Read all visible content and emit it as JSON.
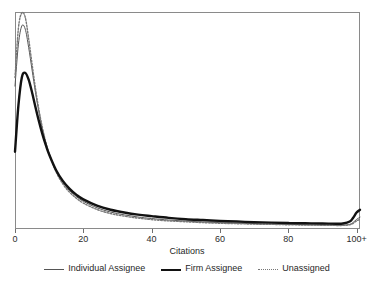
{
  "chart_data": {
    "type": "line",
    "title": "",
    "subtitle": "",
    "xlabel": "Citations",
    "ylabel": "",
    "xlim": [
      0,
      101
    ],
    "ylim": [
      0,
      1
    ],
    "grid": false,
    "legend_position": "bottom",
    "xticks": [
      0,
      20,
      40,
      60,
      80,
      100
    ],
    "xticklabels": [
      "0",
      "20",
      "40",
      "60",
      "80",
      "100+"
    ],
    "yticklabels": [],
    "annotations": [],
    "x": [
      0,
      1,
      2,
      3,
      4,
      5,
      6,
      7,
      8,
      9,
      10,
      12,
      14,
      16,
      18,
      20,
      24,
      28,
      32,
      36,
      40,
      45,
      50,
      55,
      60,
      65,
      70,
      75,
      80,
      85,
      90,
      94,
      96,
      98,
      99,
      100,
      101
    ],
    "series": [
      {
        "name": "Individual Assignee",
        "style": "solid-thin",
        "color": "#555555",
        "width": 1.0,
        "values": [
          0.66,
          0.855,
          0.94,
          0.925,
          0.84,
          0.735,
          0.63,
          0.54,
          0.462,
          0.398,
          0.346,
          0.266,
          0.212,
          0.174,
          0.146,
          0.124,
          0.094,
          0.074,
          0.061,
          0.051,
          0.044,
          0.037,
          0.032,
          0.028,
          0.025,
          0.022,
          0.02,
          0.018,
          0.017,
          0.015,
          0.014,
          0.013,
          0.013,
          0.017,
          0.026,
          0.04,
          0.05
        ]
      },
      {
        "name": "Firm Assignee",
        "style": "solid-thick",
        "color": "#121212",
        "width": 2.4,
        "values": [
          0.355,
          0.57,
          0.7,
          0.722,
          0.69,
          0.63,
          0.562,
          0.497,
          0.438,
          0.387,
          0.342,
          0.27,
          0.219,
          0.182,
          0.154,
          0.133,
          0.104,
          0.085,
          0.072,
          0.062,
          0.055,
          0.047,
          0.041,
          0.037,
          0.033,
          0.03,
          0.027,
          0.025,
          0.023,
          0.022,
          0.021,
          0.02,
          0.021,
          0.03,
          0.048,
          0.072,
          0.085
        ]
      },
      {
        "name": "Unassigned",
        "style": "dotted",
        "color": "#777777",
        "width": 1.4,
        "values": [
          0.7,
          0.93,
          1.0,
          0.98,
          0.88,
          0.762,
          0.648,
          0.55,
          0.468,
          0.4,
          0.345,
          0.262,
          0.205,
          0.166,
          0.138,
          0.116,
          0.086,
          0.067,
          0.055,
          0.046,
          0.039,
          0.033,
          0.029,
          0.025,
          0.022,
          0.02,
          0.018,
          0.017,
          0.015,
          0.014,
          0.013,
          0.012,
          0.012,
          0.015,
          0.022,
          0.033,
          0.041
        ]
      }
    ]
  },
  "axis": {
    "x_title": "Citations",
    "tick_labels": [
      "0",
      "20",
      "40",
      "60",
      "80",
      "100+"
    ]
  },
  "legend": {
    "entries": [
      {
        "label": "Individual Assignee",
        "swatch": "thin-line-icon"
      },
      {
        "label": "Firm Assignee",
        "swatch": "thick-line-icon"
      },
      {
        "label": "Unassigned",
        "swatch": "dotted-line-icon"
      }
    ]
  },
  "colors": {
    "frame": "#8a8a8a",
    "individual": "#555555",
    "firm": "#121212",
    "unassigned": "#777777",
    "background": "#ffffff"
  }
}
